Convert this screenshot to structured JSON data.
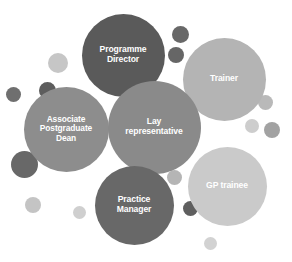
{
  "diagram": {
    "background_color": "#ffffff",
    "label_color": "#ffffff"
  },
  "chart_data": {
    "type": "bubble",
    "xlabel": "",
    "ylabel": "",
    "legend": "none",
    "grid": false,
    "categories": [
      "Programme Director",
      "Trainer",
      "Associate Postgraduate Dean",
      "Lay representative",
      "GP trainee",
      "Practice Manager"
    ],
    "values": [
      83,
      83,
      85,
      93,
      79,
      79
    ],
    "bubbles": [
      {
        "label": "Programme\nDirector",
        "name": "programme-director",
        "cx": 123,
        "cy": 55,
        "d": 83,
        "color": "#5a5a5a",
        "font_size": 8.6
      },
      {
        "label": "Trainer",
        "name": "trainer",
        "cx": 224,
        "cy": 79,
        "d": 83,
        "color": "#b4b4b4",
        "font_size": 8.6
      },
      {
        "label": "Associate\nPostgraduate\nDean",
        "name": "associate-postgraduate-dean",
        "cx": 66,
        "cy": 129,
        "d": 85,
        "color": "#8d8d8d",
        "font_size": 8.4
      },
      {
        "label": "Lay\nrepresentative",
        "name": "lay-representative",
        "cx": 154,
        "cy": 127,
        "d": 93,
        "color": "#8a8a8a",
        "font_size": 8.6
      },
      {
        "label": "GP trainee",
        "name": "gp-trainee",
        "cx": 227,
        "cy": 186,
        "d": 79,
        "color": "#cacaca",
        "font_size": 8.6
      },
      {
        "label": "Practice\nManager",
        "name": "practice-manager",
        "cx": 134,
        "cy": 205,
        "d": 79,
        "color": "#686868",
        "font_size": 8.6
      }
    ],
    "decorations": [
      {
        "name": "deco-light-top-left",
        "cx": 58,
        "cy": 63,
        "d": 20,
        "color": "#c6c6c6"
      },
      {
        "name": "deco-dark-left-upper",
        "cx": 47,
        "cy": 90,
        "d": 17,
        "color": "#5d5d5d"
      },
      {
        "name": "deco-dark-left-edge",
        "cx": 13,
        "cy": 94,
        "d": 15,
        "color": "#6f6f6f"
      },
      {
        "name": "deco-dark-left-lower",
        "cx": 24,
        "cy": 164,
        "d": 27,
        "color": "#686868"
      },
      {
        "name": "deco-light-bottom-left",
        "cx": 33,
        "cy": 205,
        "d": 16,
        "color": "#c4c4c4"
      },
      {
        "name": "deco-light-bottom-mid",
        "cx": 79,
        "cy": 212,
        "d": 13,
        "color": "#cfcfcf"
      },
      {
        "name": "deco-dark-top-mid",
        "cx": 180,
        "cy": 34,
        "d": 17,
        "color": "#686868"
      },
      {
        "name": "deco-dark-top-mid-lower",
        "cx": 176,
        "cy": 55,
        "d": 16,
        "color": "#666666"
      },
      {
        "name": "deco-mid-right-upper",
        "cx": 265,
        "cy": 102,
        "d": 15,
        "color": "#b9b9b9"
      },
      {
        "name": "deco-light-right",
        "cx": 252,
        "cy": 126,
        "d": 14,
        "color": "#cdcdcd"
      },
      {
        "name": "deco-dark-right",
        "cx": 272,
        "cy": 130,
        "d": 16,
        "color": "#a2a2a2"
      },
      {
        "name": "deco-light-center-lower",
        "cx": 174,
        "cy": 177,
        "d": 15,
        "color": "#b5b5b5"
      },
      {
        "name": "deco-dark-bottom-mid",
        "cx": 190,
        "cy": 208,
        "d": 15,
        "color": "#5f5f5f"
      },
      {
        "name": "deco-light-bottom-right",
        "cx": 210,
        "cy": 243,
        "d": 13,
        "color": "#d2d2d2"
      }
    ]
  }
}
